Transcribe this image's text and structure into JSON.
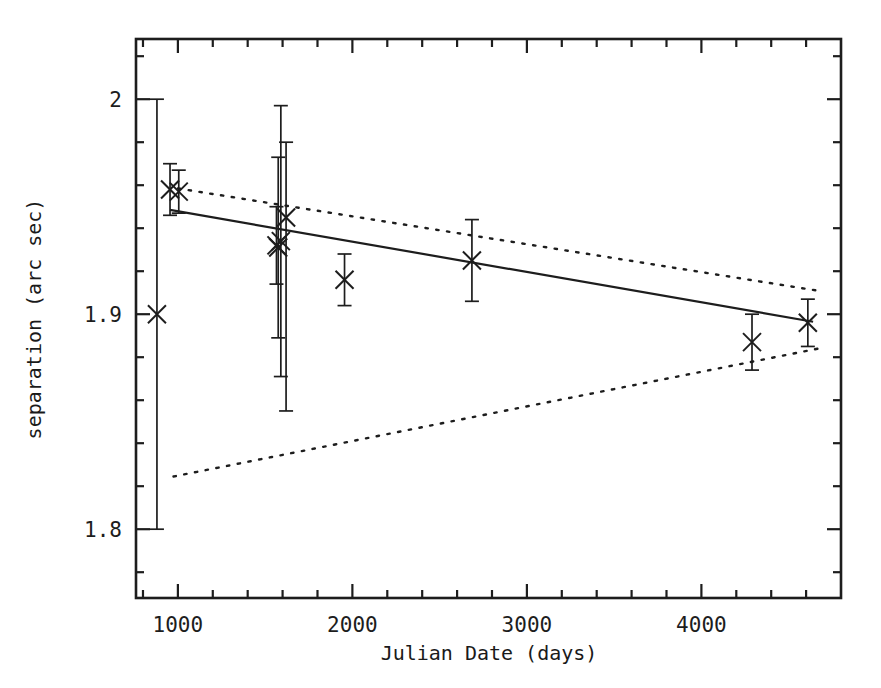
{
  "chart_data": {
    "type": "scatter",
    "title": "",
    "xlabel": "Julian Date (days)",
    "ylabel": "separation (arc sec)",
    "xlim": [
      760,
      4800
    ],
    "ylim": [
      1.768,
      2.028
    ],
    "grid": false,
    "legend": "none",
    "x_ticks_major": [
      1000,
      2000,
      3000,
      4000
    ],
    "x_tick_labels": [
      "1000",
      "2000",
      "3000",
      "4000"
    ],
    "x_minor_interval": 200,
    "y_ticks_major": [
      2.0,
      1.9,
      1.8
    ],
    "y_tick_labels": [
      "2",
      "1.9",
      "1.8"
    ],
    "y_minor_interval": 0.02,
    "marker": "x-cross",
    "error_bars": "vertical",
    "points": [
      {
        "x": 880,
        "y": 1.9,
        "yerr_low": 0.1,
        "yerr_high": 0.1
      },
      {
        "x": 955,
        "y": 1.958,
        "yerr_low": 0.012,
        "yerr_high": 0.012
      },
      {
        "x": 1005,
        "y": 1.957,
        "yerr_low": 0.01,
        "yerr_high": 0.01
      },
      {
        "x": 1565,
        "y": 1.932,
        "yerr_low": 0.018,
        "yerr_high": 0.018
      },
      {
        "x": 1575,
        "y": 1.931,
        "yerr_low": 0.042,
        "yerr_high": 0.042
      },
      {
        "x": 1590,
        "y": 1.934,
        "yerr_low": 0.063,
        "yerr_high": 0.063
      },
      {
        "x": 1620,
        "y": 1.945,
        "yerr_low": 0.09,
        "yerr_high": 0.035
      },
      {
        "x": 1955,
        "y": 1.916,
        "yerr_low": 0.012,
        "yerr_high": 0.012
      },
      {
        "x": 2685,
        "y": 1.925,
        "yerr_low": 0.019,
        "yerr_high": 0.019
      },
      {
        "x": 4290,
        "y": 1.887,
        "yerr_low": 0.013,
        "yerr_high": 0.013
      },
      {
        "x": 4610,
        "y": 1.896,
        "yerr_low": 0.011,
        "yerr_high": 0.011
      }
    ],
    "fit_line": {
      "style": "solid",
      "x_start": 955,
      "y_start": 1.9485,
      "x_end": 4640,
      "y_end": 1.8965
    },
    "confidence_bands": [
      {
        "name": "upper-confidence-band",
        "style": "dotted",
        "x_start": 1000,
        "y_start": 1.9585,
        "x_end": 4700,
        "y_end": 1.9105
      },
      {
        "name": "lower-confidence-band",
        "style": "dotted",
        "x_start": 975,
        "y_start": 1.8245,
        "x_end": 4700,
        "y_end": 1.8845
      }
    ]
  },
  "axes": {
    "x_title": "Julian Date (days)",
    "y_title": "separation (arc sec)"
  }
}
